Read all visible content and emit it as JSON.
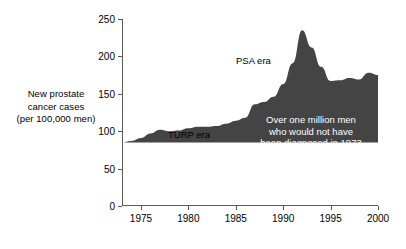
{
  "chart_data": {
    "type": "area",
    "title": "",
    "xlabel": "",
    "ylabel": "New prostate cancer cases (per 100,000 men)",
    "ylabel_lines": [
      "New prostate",
      "cancer cases",
      "(per 100,000 men)"
    ],
    "xlim": [
      1973,
      2000
    ],
    "ylim": [
      0,
      250
    ],
    "yticks": [
      0,
      50,
      100,
      150,
      200,
      250
    ],
    "ytick_labels": [
      "0",
      "50",
      "100",
      "150",
      "200",
      "250"
    ],
    "xticks": [
      1975,
      1980,
      1985,
      1990,
      1995,
      2000
    ],
    "xtick_labels": [
      "1975",
      "1980",
      "1985",
      "1990",
      "1995",
      "2000"
    ],
    "grid": false,
    "legend": false,
    "fill_color": "#444444",
    "baseline_value": 85,
    "x": [
      1973,
      1974,
      1975,
      1976,
      1977,
      1978,
      1979,
      1980,
      1981,
      1982,
      1983,
      1984,
      1985,
      1986,
      1987,
      1988,
      1989,
      1990,
      1991,
      1992,
      1993,
      1994,
      1995,
      1996,
      1997,
      1998,
      1999,
      2000
    ],
    "values": [
      85,
      87,
      91,
      97,
      102,
      100,
      101,
      104,
      106,
      106,
      107,
      110,
      114,
      118,
      136,
      139,
      146,
      163,
      191,
      235,
      212,
      186,
      167,
      168,
      171,
      169,
      178,
      175
    ],
    "annotations": [
      {
        "id": "turp-era",
        "text": "TURP era",
        "x": 1980,
        "y": 118,
        "color": "#000000"
      },
      {
        "id": "psa-era",
        "text": "PSA era",
        "x": 1988.5,
        "y": 210,
        "color": "#000000"
      },
      {
        "id": "callout",
        "lines": [
          "Over one million men",
          "who would not have",
          "been diagnosed in 1973"
        ],
        "color": "#ffffff"
      }
    ]
  },
  "axis": {
    "ylabel_lines": [
      "New prostate",
      "cancer cases",
      "(per 100,000 men)"
    ],
    "ytick_labels": [
      "250",
      "200",
      "150",
      "100",
      "50",
      "0"
    ],
    "xtick_labels": [
      "1975",
      "1980",
      "1985",
      "1990",
      "1995",
      "2000"
    ]
  },
  "annotations": {
    "turp": "TURP era",
    "psa": "PSA era",
    "callout_line1": "Over one million men",
    "callout_line2": "who would not have",
    "callout_line3": "been diagnosed in 1973"
  }
}
